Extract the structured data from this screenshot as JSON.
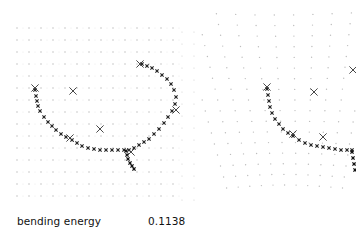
{
  "figure": {
    "type": "thin-plate spline deformation",
    "panels": [
      {
        "name": "reference",
        "grid": {
          "x0": 17,
          "y0": 28,
          "dx": 12,
          "dy": 12,
          "cols": 14,
          "rows": 15,
          "color": "#b8b8b8"
        },
        "landmarks": [
          [
            35,
            88
          ],
          [
            73,
            91
          ],
          [
            100,
            129
          ],
          [
            140,
            64
          ],
          [
            176,
            110
          ],
          [
            70,
            138
          ],
          [
            131,
            152
          ]
        ],
        "curve": [
          [
            35,
            90
          ],
          [
            36,
            96
          ],
          [
            37,
            101
          ],
          [
            38,
            106
          ],
          [
            40,
            111
          ],
          [
            44,
            117
          ],
          [
            48,
            122
          ],
          [
            52,
            126
          ],
          [
            56,
            130
          ],
          [
            61,
            134
          ],
          [
            66,
            137
          ],
          [
            72,
            140
          ],
          [
            77,
            143
          ],
          [
            82,
            146
          ],
          [
            88,
            148
          ],
          [
            94,
            149
          ],
          [
            100,
            150
          ],
          [
            106,
            150
          ],
          [
            112,
            150
          ],
          [
            118,
            150
          ],
          [
            124,
            150
          ],
          [
            129,
            150
          ],
          [
            134,
            148
          ],
          [
            139,
            145
          ],
          [
            144,
            142
          ],
          [
            149,
            139
          ],
          [
            154,
            134
          ],
          [
            159,
            129
          ],
          [
            164,
            123
          ],
          [
            168,
            117
          ],
          [
            172,
            111
          ],
          [
            175,
            104
          ],
          [
            176,
            97
          ],
          [
            174,
            90
          ],
          [
            171,
            84
          ],
          [
            167,
            79
          ],
          [
            162,
            75
          ],
          [
            157,
            71
          ],
          [
            152,
            68
          ],
          [
            147,
            66
          ],
          [
            142,
            64
          ]
        ],
        "branch": [
          [
            126,
            151
          ],
          [
            127,
            155
          ],
          [
            128,
            159
          ],
          [
            130,
            163
          ],
          [
            132,
            166
          ],
          [
            134,
            169
          ]
        ]
      },
      {
        "name": "warped",
        "landmarks": [
          [
            267,
            87
          ],
          [
            314,
            92
          ],
          [
            323,
            137
          ],
          [
            353,
            70
          ],
          [
            293,
            134
          ]
        ],
        "curve": [
          [
            267,
            89
          ],
          [
            268,
            95
          ],
          [
            269,
            101
          ],
          [
            270,
            107
          ],
          [
            272,
            113
          ],
          [
            275,
            119
          ],
          [
            279,
            124
          ],
          [
            283,
            129
          ],
          [
            288,
            133
          ],
          [
            293,
            136
          ],
          [
            299,
            140
          ],
          [
            305,
            143
          ],
          [
            311,
            145
          ],
          [
            317,
            146
          ],
          [
            323,
            147
          ],
          [
            329,
            148
          ],
          [
            335,
            149
          ],
          [
            341,
            150
          ],
          [
            347,
            150
          ],
          [
            352,
            150
          ]
        ],
        "branch": [
          [
            352,
            152
          ],
          [
            353,
            158
          ],
          [
            354,
            164
          ],
          [
            355,
            170
          ]
        ]
      }
    ]
  },
  "caption": {
    "label": "bending energy",
    "value": "0.1138"
  }
}
